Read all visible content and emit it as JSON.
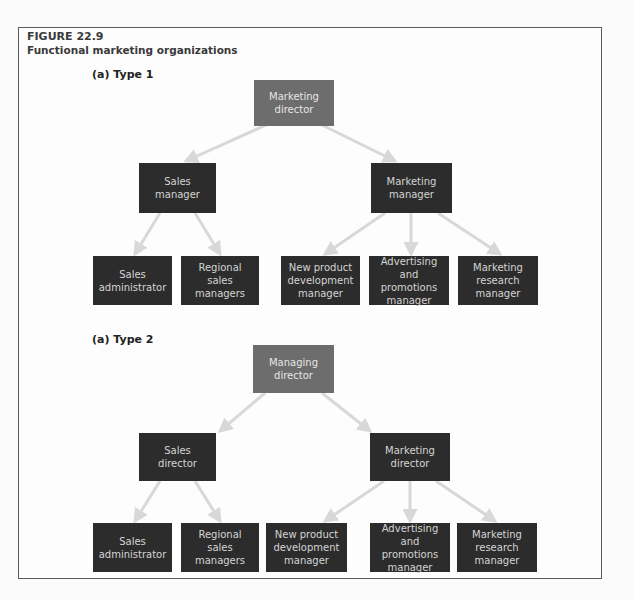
{
  "figure": {
    "number": "FIGURE 22.9",
    "title": "Functional marketing organizations"
  },
  "colors": {
    "top_node": "#6d6d6d",
    "node": "#2c2c2c",
    "node_text": "#d4d4d4",
    "arrow": "#d8d8d8",
    "frame_border": "#5a5a5a"
  },
  "type1": {
    "label": "(a) Type 1",
    "root": {
      "label": "Marketing director"
    },
    "level2": [
      {
        "label": "Sales manager"
      },
      {
        "label": "Marketing manager"
      }
    ],
    "level3": [
      {
        "label": "Sales administrator",
        "parent": "Sales manager"
      },
      {
        "label": "Regional sales managers",
        "parent": "Sales manager"
      },
      {
        "label": "New product development manager",
        "parent": "Marketing manager"
      },
      {
        "label": "Advertising and promotions manager",
        "parent": "Marketing manager"
      },
      {
        "label": "Marketing research manager",
        "parent": "Marketing manager"
      }
    ]
  },
  "type2": {
    "label": "(a) Type 2",
    "root": {
      "label": "Managing director"
    },
    "level2": [
      {
        "label": "Sales director"
      },
      {
        "label": "Marketing director"
      }
    ],
    "level3": [
      {
        "label": "Sales administrator",
        "parent": "Sales director"
      },
      {
        "label": "Regional sales managers",
        "parent": "Sales director"
      },
      {
        "label": "New product development manager",
        "parent": "Marketing director"
      },
      {
        "label": "Advertising and promotions manager",
        "parent": "Marketing director"
      },
      {
        "label": "Marketing research manager",
        "parent": "Marketing director"
      }
    ]
  }
}
